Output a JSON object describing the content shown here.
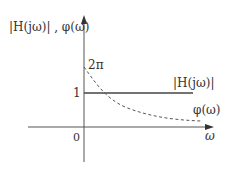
{
  "diagram": {
    "y_axis_label": "|H(jω)| ,  φ(ω)",
    "x_axis_label": "ω",
    "origin_label": "0",
    "level_one_label": "1",
    "phase_start_label": "2π",
    "magnitude_curve_label": "|H(jω)|",
    "phase_curve_label": "φ(ω)",
    "colors": {
      "axis": "#555555",
      "magnitude_line": "#444444",
      "phase_curve": "#555555",
      "text": "#333333"
    }
  }
}
